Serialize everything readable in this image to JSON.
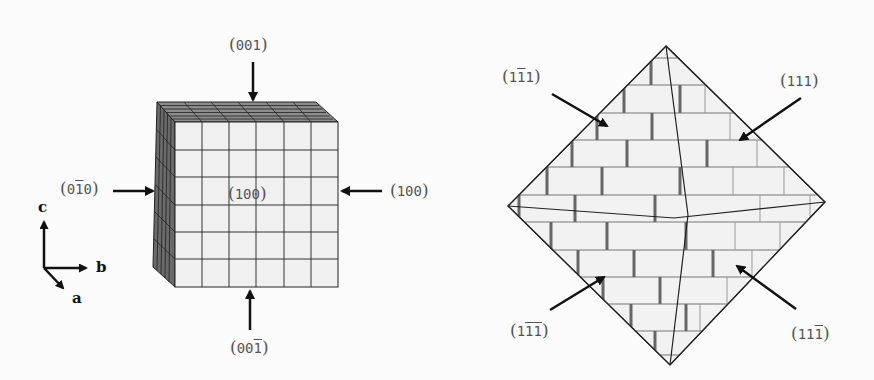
{
  "figure_left": {
    "title": "cubic crystal",
    "face_labels": [
      {
        "id": "top",
        "text": "(001)",
        "digits": [
          "0",
          "0",
          "1"
        ],
        "bar": [
          false,
          false,
          false
        ]
      },
      {
        "id": "left",
        "text": "(0-10)",
        "digits": [
          "0",
          "1",
          "0"
        ],
        "bar": [
          false,
          true,
          false
        ]
      },
      {
        "id": "center",
        "text": "(100)",
        "digits": [
          "1",
          "0",
          "0"
        ],
        "bar": [
          false,
          false,
          false
        ]
      },
      {
        "id": "right",
        "text": "(100)",
        "digits": [
          "1",
          "0",
          "0"
        ],
        "bar": [
          false,
          false,
          false
        ]
      },
      {
        "id": "bottom",
        "text": "(00-1)",
        "digits": [
          "0",
          "0",
          "1"
        ],
        "bar": [
          false,
          false,
          true
        ]
      }
    ],
    "axes": {
      "c": "c",
      "b": "b",
      "a": "a"
    },
    "grid": {
      "rows": 6,
      "cols": 6
    }
  },
  "figure_right": {
    "title": "octahedral crystal",
    "face_labels": [
      {
        "id": "upper-left",
        "text": "(1-11)",
        "digits": [
          "1",
          "1",
          "1"
        ],
        "bar": [
          false,
          true,
          false
        ]
      },
      {
        "id": "upper-right",
        "text": "(111)",
        "digits": [
          "1",
          "1",
          "1"
        ],
        "bar": [
          false,
          false,
          false
        ]
      },
      {
        "id": "lower-left",
        "text": "(1-1-1)",
        "digits": [
          "1",
          "1",
          "1"
        ],
        "bar": [
          false,
          true,
          true
        ]
      },
      {
        "id": "lower-right",
        "text": "(11-1)",
        "digits": [
          "1",
          "1",
          "1"
        ],
        "bar": [
          false,
          false,
          true
        ]
      }
    ]
  }
}
